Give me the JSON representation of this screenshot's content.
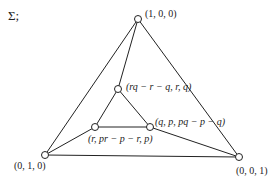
{
  "title": "Σ;",
  "vertices": {
    "outer_top": {
      "label": "(1, 0, 0)"
    },
    "outer_left": {
      "label": "(0, 1, 0)"
    },
    "outer_right": {
      "label": "(0, 0, 1)"
    },
    "inner_top": {
      "label": "(rq − r − q, r, q)"
    },
    "inner_left": {
      "label": "(r, pr − p − r, p)"
    },
    "inner_right": {
      "label": "(q, p, pq − p − q)"
    }
  },
  "colors": {
    "line": "#222222",
    "node_fill": "#ffffff"
  }
}
